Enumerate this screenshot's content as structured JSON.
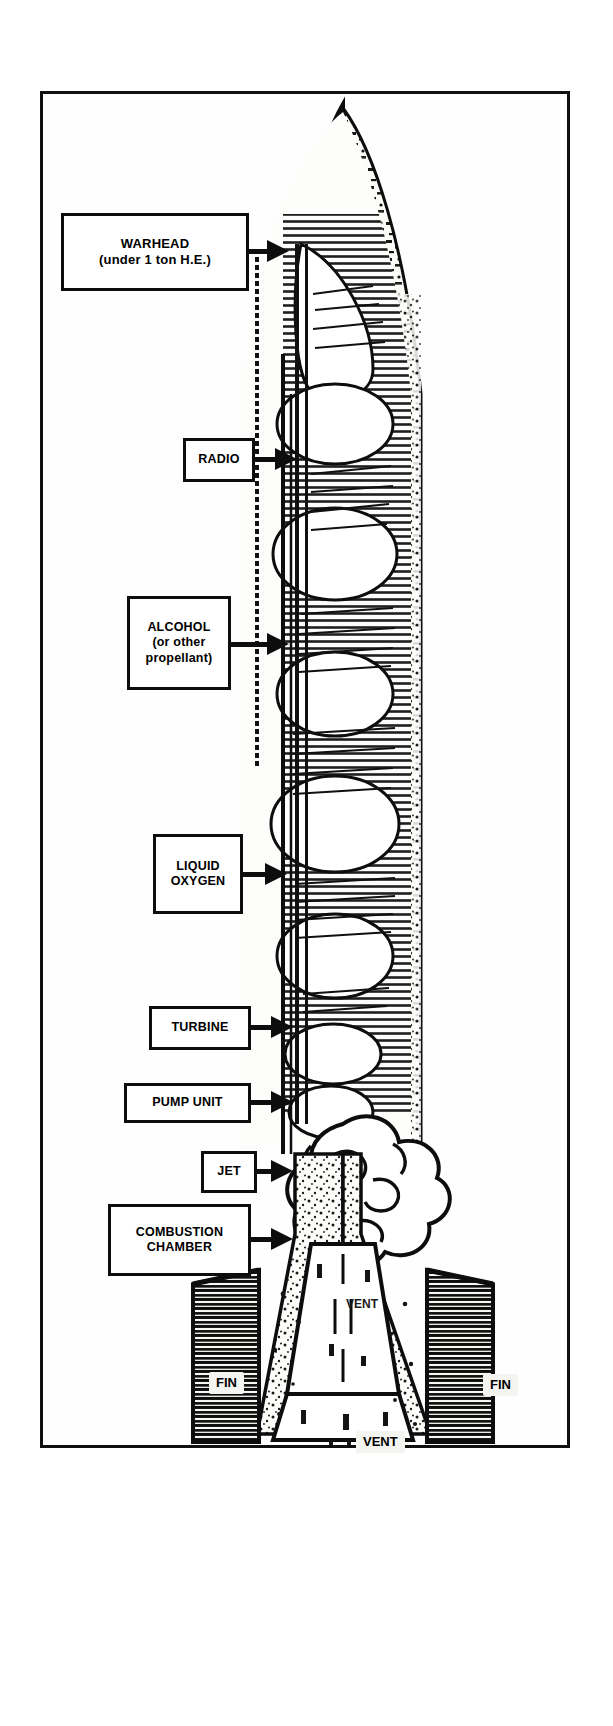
{
  "figure": {
    "kind": "technical-cutaway-diagram",
    "orientation": "vertical",
    "border_color": "#101010",
    "background_color": "#ffffff",
    "ink_color": "#0d0d0d"
  },
  "callouts": [
    {
      "id": "warhead",
      "name": "warhead",
      "lines": [
        "WARHEAD",
        "(under 1 ton H.E.)"
      ],
      "line1": "WARHEAD",
      "line2": "(under 1 ton H.E.)"
    },
    {
      "id": "radio",
      "name": "radio",
      "lines": [
        "RADIO"
      ],
      "line1": "RADIO"
    },
    {
      "id": "alcohol",
      "name": "alcohol",
      "lines": [
        "ALCOHOL",
        "(or other",
        "propellant)"
      ],
      "line1": "ALCOHOL",
      "line2": "(or other",
      "line3": "propellant)"
    },
    {
      "id": "liquid-oxygen",
      "name": "liquid oxygen",
      "lines": [
        "LIQUID",
        "OXYGEN"
      ],
      "line1": "LIQUID",
      "line2": "OXYGEN"
    },
    {
      "id": "turbine",
      "name": "turbine",
      "lines": [
        "TURBINE"
      ],
      "line1": "TURBINE"
    },
    {
      "id": "pump-unit",
      "name": "pump unit",
      "lines": [
        "PUMP UNIT"
      ],
      "line1": "PUMP UNIT"
    },
    {
      "id": "jet",
      "name": "jet",
      "lines": [
        "JET"
      ],
      "line1": "JET"
    },
    {
      "id": "combustion-chamber",
      "name": "combustion chamber",
      "lines": [
        "COMBUSTION",
        "CHAMBER"
      ],
      "line1": "COMBUSTION",
      "line2": "CHAMBER"
    }
  ],
  "inner_labels": {
    "vent_upper": "VENT",
    "vent_lower": "VENT",
    "fin_left": "FIN",
    "fin_right": "FIN"
  }
}
